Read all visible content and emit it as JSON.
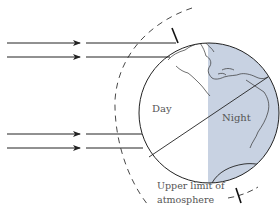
{
  "diagram": {
    "labels": {
      "day": "Day",
      "night": "Night",
      "atmosphere_line1": "Upper limit of",
      "atmosphere_line2": "atmosphere"
    },
    "rays": [
      {
        "name": "ray-1"
      },
      {
        "name": "ray-2"
      },
      {
        "name": "ray-3"
      },
      {
        "name": "ray-4"
      }
    ],
    "colors": {
      "night_shade": "#c8d2e2",
      "line": "#222222",
      "text": "#555555",
      "background": "#ffffff"
    }
  }
}
